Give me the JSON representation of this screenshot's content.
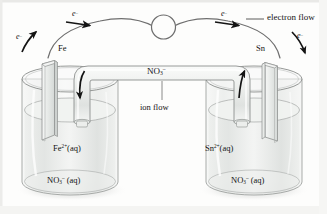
{
  "figure": {
    "background_color": "#fdfdfc",
    "ink_color": "#3a3a3a",
    "glass_color": "#e8eae8"
  },
  "circuit": {
    "meter_icon": "circle-lamp-icon",
    "electron_flow_label": "electron flow",
    "electron_labels": [
      {
        "id": "e-left-electrode",
        "text": "e",
        "charge": "–"
      },
      {
        "id": "e-left-wire",
        "text": "e",
        "charge": "–"
      },
      {
        "id": "e-right-wire",
        "text": "e",
        "charge": "–"
      },
      {
        "id": "e-right-electrode",
        "text": "e",
        "charge": "–"
      }
    ]
  },
  "salt_bridge": {
    "ion_label_main": "NO",
    "ion_label_sub": "3",
    "ion_label_sup": "–",
    "caption": "ion flow",
    "left_arrow_direction": "down",
    "right_arrow_direction": "up"
  },
  "half_cells": {
    "left": {
      "electrode_label": "Fe",
      "cation_main": "Fe",
      "cation_sup": "2+",
      "cation_state": "(aq)",
      "anion_main": "NO",
      "anion_sub": "3",
      "anion_sup": "–",
      "anion_state": "(aq)"
    },
    "right": {
      "electrode_label": "Sn",
      "cation_main": "Sn",
      "cation_sup": "2+",
      "cation_state": "(aq)",
      "anion_main": "NO",
      "anion_sub": "3",
      "anion_sup": "–",
      "anion_state": "(aq)"
    }
  }
}
